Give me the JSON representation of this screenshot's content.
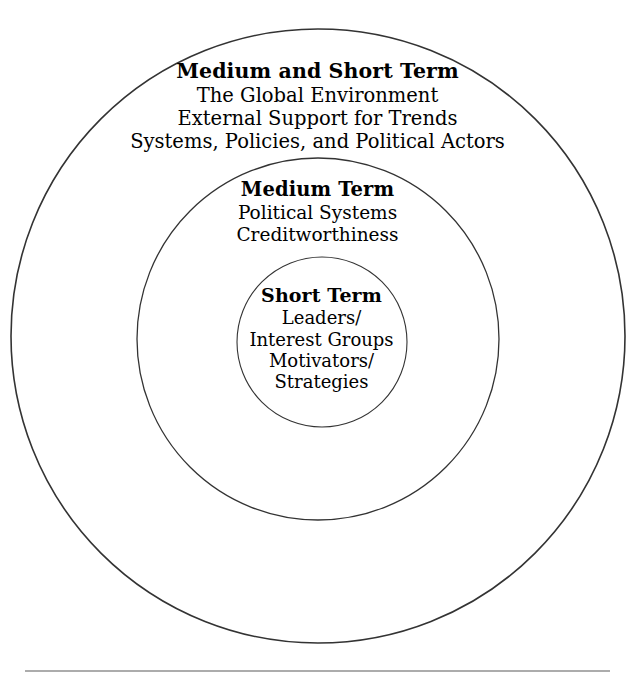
{
  "page": {
    "background_color": "#ffffff",
    "text_color": "#000000",
    "stroke_color": "#333333"
  },
  "diagram": {
    "type": "concentric-circles",
    "rings": [
      {
        "id": "outer",
        "title": "Medium and Short Term",
        "lines": [
          "The Global Environment",
          "External Support for Trends",
          "Systems, Policies, and Political Actors"
        ],
        "geometry": {
          "cx": 318,
          "cy": 336,
          "r": 307
        }
      },
      {
        "id": "middle",
        "title": "Medium Term",
        "lines": [
          "Political Systems",
          "Creditworthiness"
        ],
        "geometry": {
          "cx": 318,
          "cy": 339,
          "r": 181
        }
      },
      {
        "id": "inner",
        "title": "Short Term",
        "lines": [
          "Leaders/",
          "Interest Groups",
          "Motivators/",
          "Strategies"
        ],
        "geometry": {
          "cx": 322,
          "cy": 342,
          "r": 85
        }
      }
    ]
  },
  "footer_rule": {
    "label": "horizontal-rule",
    "y": 671,
    "x_start": 25,
    "x_end": 610
  }
}
